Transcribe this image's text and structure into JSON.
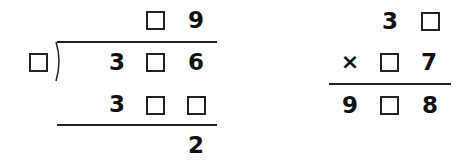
{
  "division": {
    "quotient": [
      "□",
      "9"
    ],
    "divisor": "□",
    "dividend": [
      "3",
      "□",
      "6"
    ],
    "product": [
      "3",
      "□",
      "□"
    ],
    "remainder": "2"
  },
  "multiplication": {
    "multiplicand": [
      "3",
      "□"
    ],
    "operator": "×",
    "multiplier": [
      "□",
      "7"
    ],
    "result": [
      "9",
      "□",
      "8"
    ]
  }
}
